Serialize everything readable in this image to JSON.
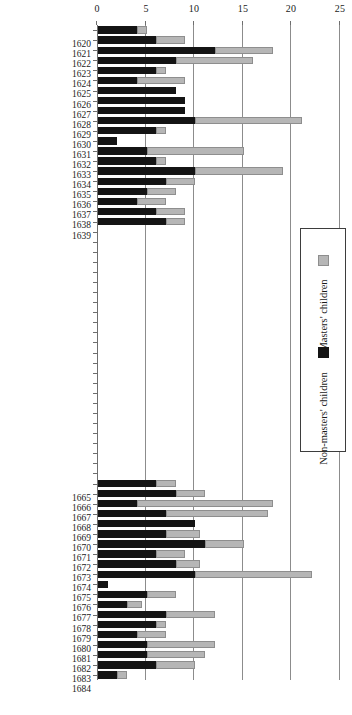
{
  "chart_data": {
    "type": "bar",
    "orientation": "rotated-90",
    "stacked": true,
    "title": "",
    "xlabel": "",
    "ylabel": "",
    "ylim": [
      0,
      25
    ],
    "yticks": [
      "0",
      "5",
      "10",
      "15",
      "20",
      "25"
    ],
    "grid": true,
    "legend_position": "right",
    "categories": [
      "1620",
      "1621",
      "1622",
      "1623",
      "1624",
      "1625",
      "1626",
      "1627",
      "1628",
      "1629",
      "1630",
      "1631",
      "1632",
      "1633",
      "1634",
      "1635",
      "1636",
      "1637",
      "1638",
      "1639",
      "1640",
      "1641",
      "1642",
      "1643",
      "1644",
      "1645",
      "1646",
      "1647",
      "1648",
      "1649",
      "1650",
      "1651",
      "1652",
      "1653",
      "1654",
      "1655",
      "1656",
      "1657",
      "1658",
      "1659",
      "1660",
      "1661",
      "1662",
      "1663",
      "1664",
      "1665",
      "1666",
      "1667",
      "1668",
      "1669",
      "1670",
      "1671",
      "1672",
      "1673",
      "1674",
      "1675",
      "1676",
      "1677",
      "1678",
      "1679",
      "1680",
      "1681",
      "1682",
      "1683",
      "1684"
    ],
    "labelled_categories": [
      "1620",
      "1621",
      "1622",
      "1623",
      "1624",
      "1625",
      "1626",
      "1627",
      "1628",
      "1629",
      "1630",
      "1631",
      "1632",
      "1633",
      "1634",
      "1635",
      "1636",
      "1637",
      "1638",
      "1639",
      "1665",
      "1666",
      "1667",
      "1668",
      "1669",
      "1670",
      "1671",
      "1672",
      "1673",
      "1674",
      "1675",
      "1676",
      "1677",
      "1678",
      "1679",
      "1680",
      "1681",
      "1682",
      "1683",
      "1684"
    ],
    "series": [
      {
        "name": "Non-masters' children",
        "color": "#141414",
        "values": [
          4.0,
          6.0,
          12.0,
          8.0,
          6.0,
          4.0,
          8.0,
          9.0,
          9.0,
          10.0,
          6.0,
          2.0,
          5.0,
          6.0,
          10.0,
          7.0,
          5.0,
          4.0,
          6.0,
          7.0,
          0,
          0,
          0,
          0,
          0,
          0,
          0,
          0,
          0,
          0,
          0,
          0,
          0,
          0,
          0,
          0,
          0,
          0,
          0,
          0,
          0,
          0,
          0,
          0,
          0,
          6.0,
          8.0,
          4.0,
          7.0,
          10.0,
          7.0,
          11.0,
          6.0,
          8.0,
          10.0,
          1.0,
          5.0,
          3.0,
          7.0,
          6.0,
          4.0,
          5.0,
          5.0,
          6.0,
          2.0
        ]
      },
      {
        "name": "Masters' children",
        "color": "#b6b6b6",
        "values": [
          1.0,
          3.0,
          6.0,
          8.0,
          1.0,
          5.0,
          0.0,
          0.0,
          0.0,
          11.0,
          1.0,
          0.0,
          10.0,
          1.0,
          9.0,
          3.0,
          3.0,
          3.0,
          3.0,
          2.0,
          0,
          0,
          0,
          0,
          0,
          0,
          0,
          0,
          0,
          0,
          0,
          0,
          0,
          0,
          0,
          0,
          0,
          0,
          0,
          0,
          0,
          0,
          0,
          0,
          0,
          2.0,
          3.0,
          14.0,
          10.5,
          0.0,
          3.5,
          4.0,
          3.0,
          2.5,
          12.0,
          0.0,
          3.0,
          1.5,
          5.0,
          1.0,
          3.0,
          7.0,
          6.0,
          4.0,
          1.0
        ]
      }
    ]
  },
  "legend": {
    "entries": [
      {
        "label": "Masters' children",
        "swatch": "gray"
      },
      {
        "label": "Non-masters' children",
        "swatch": "black"
      }
    ]
  }
}
